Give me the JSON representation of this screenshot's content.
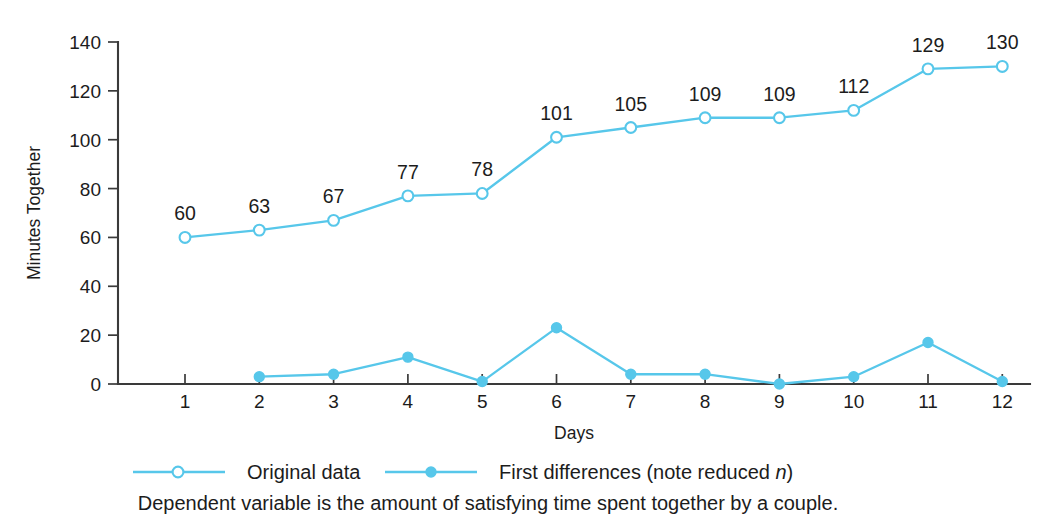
{
  "chart_data": {
    "type": "line",
    "title": "",
    "xlabel": "Days",
    "ylabel": "Minutes Together",
    "x": [
      1,
      2,
      3,
      4,
      5,
      6,
      7,
      8,
      9,
      10,
      11,
      12
    ],
    "xticklabels": [
      "1",
      "2",
      "3",
      "4",
      "5",
      "6",
      "7",
      "8",
      "9",
      "10",
      "11",
      "12"
    ],
    "yticklabels": [
      "0",
      "20",
      "40",
      "60",
      "80",
      "100",
      "120",
      "140"
    ],
    "yticks": [
      0,
      20,
      40,
      60,
      80,
      100,
      120,
      140
    ],
    "ylim": [
      0,
      140
    ],
    "xlim": [
      0.6,
      12.4
    ],
    "grid": false,
    "legend_position": "below-axes",
    "series": [
      {
        "name": "Original data",
        "marker": "open-circle",
        "color": "#57c7ea",
        "x": [
          1,
          2,
          3,
          4,
          5,
          6,
          7,
          8,
          9,
          10,
          11,
          12
        ],
        "values": [
          60,
          63,
          67,
          77,
          78,
          101,
          105,
          109,
          109,
          112,
          129,
          130
        ],
        "data_labels": [
          "60",
          "63",
          "67",
          "77",
          "78",
          "101",
          "105",
          "109",
          "109",
          "112",
          "129",
          "130"
        ],
        "show_data_labels": true
      },
      {
        "name": "First differences (note reduced n)",
        "marker": "filled-circle",
        "color": "#57c7ea",
        "x": [
          2,
          3,
          4,
          5,
          6,
          7,
          8,
          9,
          10,
          11,
          12
        ],
        "values": [
          3,
          4,
          11,
          1,
          23,
          4,
          4,
          0,
          3,
          17,
          1
        ],
        "show_data_labels": false
      }
    ],
    "annotations": [
      "Dependent variable is the amount of satisfying time spent together by a couple."
    ]
  },
  "legend": {
    "entries": [
      {
        "label": "Original data",
        "marker": "open-circle"
      },
      {
        "label_prefix": "First differences (note reduced ",
        "label_italic": "n",
        "label_suffix": ")",
        "marker": "filled-circle"
      }
    ]
  },
  "caption": {
    "text": "Dependent variable is the amount of satisfying time spent together by a couple."
  },
  "colors": {
    "series": "#57c7ea",
    "axis": "#3a3a3a",
    "text": "#1c1c1c",
    "background": "#ffffff"
  }
}
